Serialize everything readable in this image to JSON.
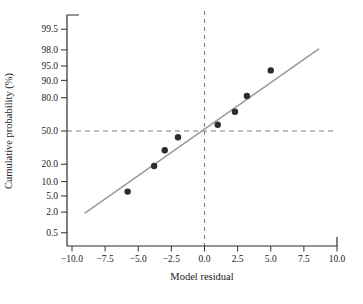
{
  "figure": {
    "background": "#ffffff"
  },
  "chart_data": {
    "type": "scatter",
    "title": "",
    "xlabel": "Model residual",
    "ylabel": "Cumulative probability (%)",
    "xlim": [
      -10,
      10
    ],
    "x_ticks": [
      -10.0,
      -7.5,
      -5.0,
      -2.5,
      0.0,
      2.5,
      5.0,
      7.5,
      10.0
    ],
    "x_tick_labels": [
      "−10.0",
      "−7.5",
      "−5.0",
      "−2.5",
      "0.0",
      "2.5",
      "5.0",
      "7.5",
      "10.0"
    ],
    "y_axis_scale": "normal-probability",
    "y_ticks": [
      99.5,
      98.0,
      95.0,
      90.0,
      80.0,
      50.0,
      20.0,
      10.0,
      5.0,
      2.0,
      0.5
    ],
    "y_tick_labels": [
      "99.5",
      "98.0",
      "95.0",
      "90.0",
      "80.0",
      "50.0",
      "20.0",
      "10.0",
      "5.0",
      "2.0",
      "0.5"
    ],
    "points": [
      {
        "x": -5.8,
        "p": 6.25
      },
      {
        "x": -3.8,
        "p": 18.75
      },
      {
        "x": -3.0,
        "p": 31.25
      },
      {
        "x": -2.0,
        "p": 43.75
      },
      {
        "x": 1.0,
        "p": 56.25
      },
      {
        "x": 2.3,
        "p": 68.75
      },
      {
        "x": 3.2,
        "p": 81.25
      },
      {
        "x": 5.0,
        "p": 93.75
      }
    ],
    "fit_line": {
      "x1": -9.0,
      "p1": 1.9,
      "x2": 8.6,
      "p2": 98.1
    },
    "reference_lines": {
      "horizontal_p": 50,
      "vertical_x": 0
    },
    "grid": false,
    "legend": false,
    "colors": {
      "point": "#2d2d2f",
      "fit_line": "#9b9b9b",
      "dashed": "#7f7f7f",
      "axis": "#2f2f2f",
      "text": "#1a1a1a"
    }
  }
}
